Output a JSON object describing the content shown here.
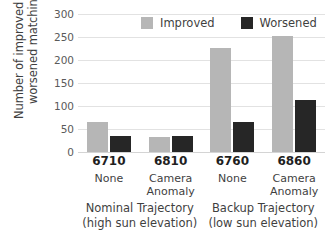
{
  "chart_data": {
    "type": "bar",
    "title": "",
    "xlabel": "",
    "ylabel": "Number of improved and worsened matching",
    "ylabel_lines": [
      "Number of improved and",
      "worsened matching"
    ],
    "ylim": [
      0,
      300
    ],
    "yticks": [
      0,
      50,
      100,
      150,
      200,
      250,
      300
    ],
    "ytick_labels": [
      "0",
      "50",
      "100",
      "150",
      "200",
      "250",
      "300"
    ],
    "grid": true,
    "legend_position": "top-center",
    "categories": [
      "6710",
      "6810",
      "6760",
      "6860"
    ],
    "category_conditions": [
      [
        "None"
      ],
      [
        "Camera",
        "Anomaly"
      ],
      [
        "None"
      ],
      [
        "Camera",
        "Anomaly"
      ]
    ],
    "series": [
      {
        "name": "Improved",
        "color": "#b6b6b6",
        "values": [
          65,
          33,
          227,
          252
        ]
      },
      {
        "name": "Worsened",
        "color": "#262626",
        "values": [
          35,
          34,
          65,
          113
        ]
      }
    ],
    "super_groups": [
      {
        "lines": [
          "Nominal Trajectory",
          "(high sun elevation)"
        ],
        "categories": [
          "6710",
          "6810"
        ]
      },
      {
        "lines": [
          "Backup Trajectory",
          "(low sun elevation)"
        ],
        "categories": [
          "6760",
          "6860"
        ]
      }
    ]
  },
  "legend": {
    "entries": [
      {
        "label": "Improved",
        "swatch": "improved"
      },
      {
        "label": "Worsened",
        "swatch": "worsened"
      }
    ]
  },
  "colors": {
    "improved": "#b6b6b6",
    "worsened": "#262626",
    "gridline": "#e2e2e2",
    "text": "#3f3f3f",
    "background": "#ffffff"
  }
}
